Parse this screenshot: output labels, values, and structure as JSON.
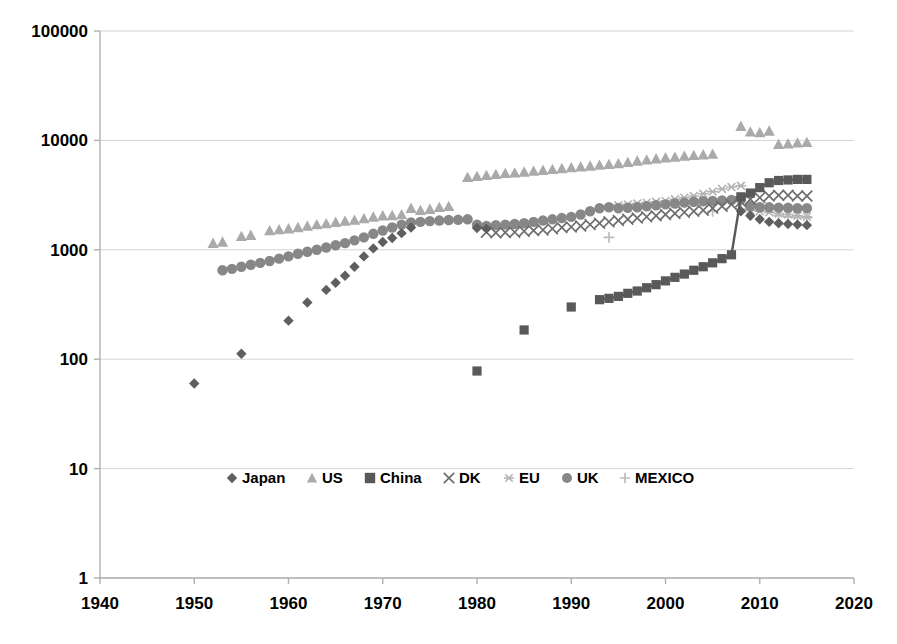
{
  "chart_data": {
    "type": "scatter",
    "title": "",
    "xlabel": "",
    "ylabel": "",
    "yscale": "log",
    "xlim": [
      1940,
      2020
    ],
    "ylim": [
      1,
      100000
    ],
    "grid": true,
    "legend_position": "inside-bottom-center",
    "x_ticks": [
      "1940",
      "1950",
      "1960",
      "1970",
      "1980",
      "1990",
      "2000",
      "2010",
      "2020"
    ],
    "y_ticks": [
      "1",
      "10",
      "100",
      "1000",
      "10000",
      "100000"
    ],
    "series": [
      {
        "name": "Japan",
        "marker": "diamond",
        "color": "#5f5f5f",
        "points": [
          [
            1950,
            60
          ],
          [
            1955,
            112
          ],
          [
            1960,
            225
          ],
          [
            1962,
            330
          ],
          [
            1964,
            430
          ],
          [
            1965,
            500
          ],
          [
            1966,
            580
          ],
          [
            1967,
            700
          ],
          [
            1968,
            870
          ],
          [
            1969,
            1030
          ],
          [
            1970,
            1180
          ],
          [
            1971,
            1280
          ],
          [
            1972,
            1420
          ],
          [
            1973,
            1600
          ],
          [
            1980,
            1580
          ],
          [
            1981,
            1560
          ],
          [
            2008,
            2250
          ],
          [
            2009,
            2050
          ],
          [
            2010,
            1900
          ],
          [
            2011,
            1800
          ],
          [
            2012,
            1750
          ],
          [
            2013,
            1720
          ],
          [
            2014,
            1700
          ],
          [
            2015,
            1680
          ]
        ]
      },
      {
        "name": "US",
        "marker": "triangle",
        "color": "#aaaaaa",
        "points": [
          [
            1952,
            1150
          ],
          [
            1953,
            1180
          ],
          [
            1955,
            1330
          ],
          [
            1956,
            1360
          ],
          [
            1958,
            1500
          ],
          [
            1959,
            1530
          ],
          [
            1960,
            1560
          ],
          [
            1961,
            1600
          ],
          [
            1962,
            1650
          ],
          [
            1963,
            1700
          ],
          [
            1964,
            1740
          ],
          [
            1965,
            1790
          ],
          [
            1966,
            1830
          ],
          [
            1967,
            1870
          ],
          [
            1968,
            1930
          ],
          [
            1969,
            2000
          ],
          [
            1970,
            2050
          ],
          [
            1971,
            2060
          ],
          [
            1972,
            2100
          ],
          [
            1973,
            2400
          ],
          [
            1974,
            2300
          ],
          [
            1975,
            2350
          ],
          [
            1976,
            2450
          ],
          [
            1977,
            2500
          ],
          [
            1979,
            4600
          ],
          [
            1980,
            4700
          ],
          [
            1981,
            4800
          ],
          [
            1982,
            4900
          ],
          [
            1983,
            5000
          ],
          [
            1984,
            5050
          ],
          [
            1985,
            5150
          ],
          [
            1986,
            5250
          ],
          [
            1987,
            5350
          ],
          [
            1988,
            5450
          ],
          [
            1989,
            5550
          ],
          [
            1990,
            5650
          ],
          [
            1991,
            5750
          ],
          [
            1992,
            5850
          ],
          [
            1993,
            5950
          ],
          [
            1994,
            6050
          ],
          [
            1995,
            6150
          ],
          [
            1996,
            6300
          ],
          [
            1997,
            6500
          ],
          [
            1998,
            6650
          ],
          [
            1999,
            6800
          ],
          [
            2000,
            6950
          ],
          [
            2001,
            7050
          ],
          [
            2002,
            7200
          ],
          [
            2003,
            7300
          ],
          [
            2004,
            7400
          ],
          [
            2005,
            7500
          ],
          [
            2008,
            13500
          ],
          [
            2009,
            12000
          ],
          [
            2010,
            11800
          ],
          [
            2011,
            12200
          ],
          [
            2012,
            9200
          ],
          [
            2013,
            9300
          ],
          [
            2014,
            9500
          ],
          [
            2015,
            9600
          ]
        ]
      },
      {
        "name": "China",
        "marker": "square",
        "color": "#595959",
        "points": [
          [
            1980,
            78
          ],
          [
            1985,
            185
          ],
          [
            1990,
            300
          ],
          [
            1993,
            350
          ],
          [
            1994,
            360
          ],
          [
            1995,
            375
          ],
          [
            1996,
            400
          ],
          [
            1997,
            420
          ],
          [
            1998,
            450
          ],
          [
            1999,
            480
          ],
          [
            2000,
            520
          ],
          [
            2001,
            560
          ],
          [
            2002,
            600
          ],
          [
            2003,
            650
          ],
          [
            2004,
            700
          ],
          [
            2005,
            760
          ],
          [
            2006,
            830
          ],
          [
            2007,
            900
          ],
          [
            2008,
            3050
          ],
          [
            2009,
            3300
          ],
          [
            2010,
            3700
          ],
          [
            2011,
            4100
          ],
          [
            2012,
            4300
          ],
          [
            2013,
            4350
          ],
          [
            2014,
            4400
          ],
          [
            2015,
            4400
          ]
        ]
      },
      {
        "name": "DK",
        "marker": "x",
        "color": "#6e6e6e",
        "points": [
          [
            1981,
            1450
          ],
          [
            1982,
            1430
          ],
          [
            1983,
            1440
          ],
          [
            1984,
            1450
          ],
          [
            1985,
            1480
          ],
          [
            1986,
            1500
          ],
          [
            1987,
            1520
          ],
          [
            1988,
            1560
          ],
          [
            1989,
            1600
          ],
          [
            1990,
            1620
          ],
          [
            1991,
            1650
          ],
          [
            1992,
            1700
          ],
          [
            1993,
            1750
          ],
          [
            1994,
            1800
          ],
          [
            1995,
            1850
          ],
          [
            1996,
            1900
          ],
          [
            1997,
            1950
          ],
          [
            1998,
            2000
          ],
          [
            1999,
            2050
          ],
          [
            2000,
            2100
          ],
          [
            2001,
            2150
          ],
          [
            2002,
            2200
          ],
          [
            2003,
            2250
          ],
          [
            2004,
            2300
          ],
          [
            2005,
            2400
          ],
          [
            2006,
            2500
          ],
          [
            2007,
            2600
          ],
          [
            2008,
            2750
          ],
          [
            2009,
            2900
          ],
          [
            2010,
            3000
          ],
          [
            2011,
            3100
          ],
          [
            2012,
            3150
          ],
          [
            2013,
            3150
          ],
          [
            2014,
            3100
          ],
          [
            2015,
            3100
          ]
        ]
      },
      {
        "name": "EU",
        "marker": "asterisk",
        "color": "#b4b4b4",
        "points": [
          [
            1995,
            2550
          ],
          [
            1996,
            2600
          ],
          [
            1997,
            2650
          ],
          [
            1998,
            2700
          ],
          [
            1999,
            2750
          ],
          [
            2000,
            2800
          ],
          [
            2001,
            2900
          ],
          [
            2002,
            3000
          ],
          [
            2003,
            3100
          ],
          [
            2004,
            3250
          ],
          [
            2005,
            3400
          ],
          [
            2006,
            3600
          ],
          [
            2007,
            3750
          ],
          [
            2008,
            3850
          ],
          [
            2009,
            2300
          ],
          [
            2010,
            2250
          ],
          [
            2011,
            2200
          ],
          [
            2012,
            2150
          ],
          [
            2013,
            2100
          ],
          [
            2014,
            2050
          ],
          [
            2015,
            2000
          ]
        ]
      },
      {
        "name": "UK",
        "marker": "circle",
        "color": "#878787",
        "points": [
          [
            1953,
            650
          ],
          [
            1954,
            670
          ],
          [
            1955,
            700
          ],
          [
            1956,
            730
          ],
          [
            1957,
            760
          ],
          [
            1958,
            790
          ],
          [
            1959,
            830
          ],
          [
            1960,
            870
          ],
          [
            1961,
            920
          ],
          [
            1962,
            960
          ],
          [
            1963,
            1000
          ],
          [
            1964,
            1050
          ],
          [
            1965,
            1100
          ],
          [
            1966,
            1150
          ],
          [
            1967,
            1220
          ],
          [
            1968,
            1300
          ],
          [
            1969,
            1400
          ],
          [
            1970,
            1500
          ],
          [
            1971,
            1600
          ],
          [
            1972,
            1700
          ],
          [
            1973,
            1780
          ],
          [
            1974,
            1800
          ],
          [
            1975,
            1830
          ],
          [
            1976,
            1850
          ],
          [
            1977,
            1870
          ],
          [
            1978,
            1880
          ],
          [
            1979,
            1900
          ],
          [
            1980,
            1700
          ],
          [
            1981,
            1650
          ],
          [
            1982,
            1680
          ],
          [
            1983,
            1700
          ],
          [
            1984,
            1720
          ],
          [
            1985,
            1750
          ],
          [
            1986,
            1800
          ],
          [
            1987,
            1850
          ],
          [
            1988,
            1900
          ],
          [
            1989,
            1950
          ],
          [
            1990,
            2000
          ],
          [
            1991,
            2100
          ],
          [
            1992,
            2250
          ],
          [
            1993,
            2400
          ],
          [
            1994,
            2450
          ],
          [
            1995,
            2400
          ],
          [
            1996,
            2420
          ],
          [
            1997,
            2450
          ],
          [
            1998,
            2500
          ],
          [
            1999,
            2550
          ],
          [
            2000,
            2600
          ],
          [
            2001,
            2650
          ],
          [
            2002,
            2700
          ],
          [
            2003,
            2750
          ],
          [
            2004,
            2780
          ],
          [
            2005,
            2800
          ],
          [
            2006,
            2820
          ],
          [
            2007,
            2850
          ],
          [
            2008,
            2900
          ],
          [
            2009,
            2500
          ],
          [
            2010,
            2450
          ],
          [
            2011,
            2450
          ],
          [
            2012,
            2430
          ],
          [
            2013,
            2420
          ],
          [
            2014,
            2400
          ],
          [
            2015,
            2400
          ]
        ]
      },
      {
        "name": "MEXICO",
        "marker": "plus",
        "color": "#bdbdbd",
        "points": [
          [
            1994,
            1300
          ],
          [
            2005,
            2250
          ],
          [
            2008,
            2350
          ],
          [
            2012,
            2050
          ],
          [
            2013,
            2000
          ],
          [
            2014,
            1980
          ],
          [
            2015,
            1970
          ]
        ]
      }
    ]
  },
  "legend": {
    "items": [
      {
        "label": "Japan",
        "marker": "diamond",
        "color": "#5f5f5f"
      },
      {
        "label": "US",
        "marker": "triangle",
        "color": "#aaaaaa"
      },
      {
        "label": "China",
        "marker": "square",
        "color": "#595959"
      },
      {
        "label": "DK",
        "marker": "x",
        "color": "#6e6e6e"
      },
      {
        "label": "EU",
        "marker": "asterisk",
        "color": "#b4b4b4"
      },
      {
        "label": "UK",
        "marker": "circle",
        "color": "#878787"
      },
      {
        "label": "MEXICO",
        "marker": "plus",
        "color": "#bdbdbd"
      }
    ]
  },
  "colors": {
    "axis": "#b0b0b0",
    "grid": "#d4d4d4",
    "text": "#000000",
    "background": "#ffffff"
  }
}
